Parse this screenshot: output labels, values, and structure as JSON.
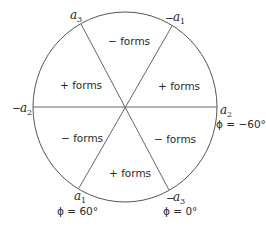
{
  "diagram": {
    "type": "circle-sector-diagram",
    "colors": {
      "stroke": "#555555",
      "text": "#2a2a2a",
      "background": "#ffffff"
    },
    "sectors": [
      {
        "id": "top",
        "label": "− forms"
      },
      {
        "id": "upper-right",
        "label": "+ forms"
      },
      {
        "id": "lower-right",
        "label": "− forms"
      },
      {
        "id": "bottom",
        "label": "+ forms"
      },
      {
        "id": "lower-left",
        "label": "− forms"
      },
      {
        "id": "upper-left",
        "label": "+ forms"
      }
    ],
    "axes": [
      {
        "id": "a3",
        "sign": "",
        "symbol": "a",
        "sub": "3"
      },
      {
        "id": "neg-a1",
        "sign": "−",
        "symbol": "a",
        "sub": "1"
      },
      {
        "id": "a2",
        "sign": "",
        "symbol": "a",
        "sub": "2"
      },
      {
        "id": "neg-a3",
        "sign": "−",
        "symbol": "a",
        "sub": "3"
      },
      {
        "id": "a1",
        "sign": "",
        "symbol": "a",
        "sub": "1"
      },
      {
        "id": "neg-a2",
        "sign": "−",
        "symbol": "a",
        "sub": "2"
      }
    ],
    "angles": [
      {
        "at": "a2",
        "label": "ϕ = −60°"
      },
      {
        "at": "neg-a3",
        "label": "ϕ = 0°"
      },
      {
        "at": "a1",
        "label": "ϕ = 60°"
      }
    ]
  }
}
